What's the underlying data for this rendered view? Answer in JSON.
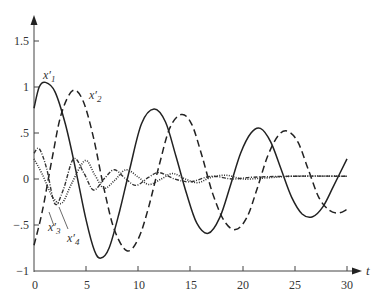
{
  "chart_data": {
    "type": "line",
    "title": "",
    "xlabel": "t",
    "ylabel": "",
    "xlim": [
      0,
      30
    ],
    "ylim": [
      -1,
      1.5
    ],
    "grid": false,
    "legend": "inline labels",
    "x_ticks": [
      {
        "value": 0,
        "label": "0"
      },
      {
        "value": 5,
        "label": "5"
      },
      {
        "value": 10,
        "label": "10"
      },
      {
        "value": 15,
        "label": "15"
      },
      {
        "value": 20,
        "label": "20"
      },
      {
        "value": 25,
        "label": "25"
      },
      {
        "value": 30,
        "label": "30"
      }
    ],
    "y_ticks": [
      {
        "value": -1,
        "label": "−1"
      },
      {
        "value": -0.5,
        "label": "−.5"
      },
      {
        "value": 0,
        "label": "0"
      },
      {
        "value": 0.5,
        "label": ".5"
      },
      {
        "value": 1,
        "label": "1"
      },
      {
        "value": 1.5,
        "label": "1.5"
      }
    ],
    "series": [
      {
        "name": "x′₁",
        "base": "x",
        "sub": "1",
        "style": "solid",
        "points": [
          [
            0,
            0.77
          ],
          [
            0.5,
            1.0
          ],
          [
            1.1,
            1.05
          ],
          [
            2,
            0.95
          ],
          [
            3,
            0.6
          ],
          [
            4,
            0.1
          ],
          [
            5,
            -0.45
          ],
          [
            5.8,
            -0.78
          ],
          [
            6.4,
            -0.86
          ],
          [
            7.2,
            -0.75
          ],
          [
            8.2,
            -0.35
          ],
          [
            9.2,
            0.12
          ],
          [
            10.3,
            0.6
          ],
          [
            11.5,
            0.76
          ],
          [
            12.6,
            0.62
          ],
          [
            13.6,
            0.25
          ],
          [
            14.6,
            -0.15
          ],
          [
            15.6,
            -0.48
          ],
          [
            16.7,
            -0.59
          ],
          [
            17.8,
            -0.42
          ],
          [
            18.8,
            -0.08
          ],
          [
            19.8,
            0.28
          ],
          [
            20.8,
            0.5
          ],
          [
            21.7,
            0.55
          ],
          [
            22.7,
            0.4
          ],
          [
            23.7,
            0.1
          ],
          [
            24.7,
            -0.2
          ],
          [
            25.7,
            -0.38
          ],
          [
            26.7,
            -0.41
          ],
          [
            27.7,
            -0.3
          ],
          [
            28.7,
            -0.08
          ],
          [
            30,
            0.22
          ]
        ]
      },
      {
        "name": "x′₂",
        "base": "x",
        "sub": "2",
        "style": "dashed",
        "points": [
          [
            0,
            -0.72
          ],
          [
            0.8,
            -0.35
          ],
          [
            1.7,
            0.2
          ],
          [
            2.6,
            0.7
          ],
          [
            3.7,
            0.96
          ],
          [
            4.7,
            0.85
          ],
          [
            5.7,
            0.45
          ],
          [
            6.7,
            -0.1
          ],
          [
            7.7,
            -0.55
          ],
          [
            8.9,
            -0.78
          ],
          [
            10,
            -0.65
          ],
          [
            11,
            -0.3
          ],
          [
            12,
            0.15
          ],
          [
            13,
            0.55
          ],
          [
            14.1,
            0.7
          ],
          [
            15.1,
            0.6
          ],
          [
            16.1,
            0.25
          ],
          [
            17.1,
            -0.15
          ],
          [
            18.2,
            -0.45
          ],
          [
            19.3,
            -0.55
          ],
          [
            20.4,
            -0.42
          ],
          [
            21.4,
            -0.1
          ],
          [
            22.4,
            0.25
          ],
          [
            23.4,
            0.47
          ],
          [
            24.3,
            0.52
          ],
          [
            25.3,
            0.4
          ],
          [
            26.3,
            0.1
          ],
          [
            27.3,
            -0.2
          ],
          [
            28.3,
            -0.34
          ],
          [
            29.2,
            -0.37
          ],
          [
            30,
            -0.33
          ]
        ]
      },
      {
        "name": "x′₃",
        "base": "x",
        "sub": "3",
        "style": "dashdot",
        "points": [
          [
            0,
            0.28
          ],
          [
            0.5,
            0.33
          ],
          [
            1.2,
            0.12
          ],
          [
            2,
            -0.27
          ],
          [
            2.8,
            -0.12
          ],
          [
            3.8,
            0.22
          ],
          [
            4.8,
            0.06
          ],
          [
            5.7,
            -0.12
          ],
          [
            6.7,
            0.0
          ],
          [
            7.7,
            0.1
          ],
          [
            8.8,
            0.0
          ],
          [
            9.8,
            -0.07
          ],
          [
            11,
            0.02
          ],
          [
            12,
            0.07
          ],
          [
            13.5,
            0.0
          ],
          [
            15,
            -0.03
          ],
          [
            17,
            0.03
          ],
          [
            19,
            0.0
          ],
          [
            21,
            0.02
          ],
          [
            25,
            0.03
          ],
          [
            30,
            0.03
          ]
        ]
      },
      {
        "name": "x′₄",
        "base": "x",
        "sub": "4",
        "style": "dotted",
        "points": [
          [
            0,
            0.22
          ],
          [
            0.8,
            0.05
          ],
          [
            1.8,
            -0.2
          ],
          [
            2.7,
            -0.26
          ],
          [
            3.6,
            -0.05
          ],
          [
            4.9,
            0.2
          ],
          [
            5.8,
            0.05
          ],
          [
            6.7,
            -0.1
          ],
          [
            7.7,
            -0.02
          ],
          [
            8.8,
            0.1
          ],
          [
            10,
            0.02
          ],
          [
            11,
            -0.06
          ],
          [
            12.2,
            0.0
          ],
          [
            13.3,
            0.06
          ],
          [
            14.5,
            0.0
          ],
          [
            15.7,
            -0.04
          ],
          [
            17,
            0.02
          ],
          [
            18.5,
            0.04
          ],
          [
            20,
            0.0
          ],
          [
            22,
            0.01
          ],
          [
            25,
            0.03
          ],
          [
            30,
            0.03
          ]
        ]
      }
    ],
    "annotations": [
      {
        "text": "x′₁",
        "series": "x′₁",
        "near_t": 1,
        "near_y": 1.15
      },
      {
        "text": "x′₂",
        "series": "x′₂",
        "near_t": 5.6,
        "near_y": 0.9
      },
      {
        "text": "x′₃",
        "series": "x′₃",
        "near_t": 1.6,
        "near_y": -0.52,
        "pointer": true
      },
      {
        "text": "x′₄",
        "series": "x′₄",
        "near_t": 3.6,
        "near_y": -0.65,
        "pointer": true
      }
    ]
  },
  "labels": {
    "x_axis": "t",
    "x1_base": "x",
    "x1_prime": "′",
    "x1_sub": "1",
    "x2_base": "x",
    "x2_prime": "′",
    "x2_sub": "2",
    "x3_base": "x",
    "x3_prime": "′",
    "x3_sub": "3",
    "x4_base": "x",
    "x4_prime": "′",
    "x4_sub": "4"
  },
  "ticks": {
    "x": [
      "0",
      "5",
      "10",
      "15",
      "20",
      "25",
      "30"
    ],
    "y": [
      "−1",
      "−.5",
      "0",
      ".5",
      "1",
      "1.5"
    ]
  }
}
